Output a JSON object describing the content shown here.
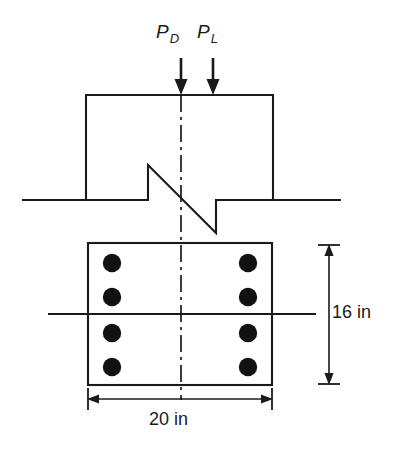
{
  "figure": {
    "stroke_color": "#1a1a1a",
    "rebar_color": "#111111",
    "background": "#ffffff",
    "loads": [
      {
        "id": "dead-load",
        "symbol": "P",
        "subscript": "D",
        "label": "PD",
        "direction": "down"
      },
      {
        "id": "live-load",
        "symbol": "P",
        "subscript": "L",
        "label": "PL",
        "direction": "down"
      }
    ],
    "dimensions": [
      {
        "id": "section-height",
        "value": "16",
        "unit": "in",
        "label": "16 in",
        "orientation": "vertical"
      },
      {
        "id": "section-width",
        "value": "20",
        "unit": "in",
        "label": "20 in",
        "orientation": "horizontal"
      }
    ],
    "rebar": {
      "count": 8,
      "per_side": 4,
      "layout": "two vertical rows of four bars"
    },
    "centerlines": {
      "vertical": "dash-dot",
      "horizontal": "solid"
    },
    "break_line": "zigzag section break across column"
  }
}
